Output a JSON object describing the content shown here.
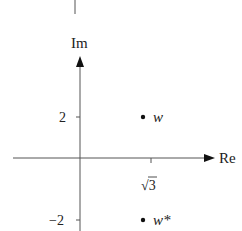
{
  "diagram": {
    "type": "argand-diagram",
    "axes": {
      "horizontal_label": "Re",
      "vertical_label": "Im"
    },
    "ticks": {
      "y_positive": "2",
      "y_negative": "−2",
      "x_tick": "√3"
    },
    "points": [
      {
        "label": "w",
        "re": "√3",
        "im": "2"
      },
      {
        "label": "w*",
        "re": "√3",
        "im": "−2"
      }
    ],
    "colors": {
      "ink": "#222222",
      "background": "#ffffff"
    }
  }
}
